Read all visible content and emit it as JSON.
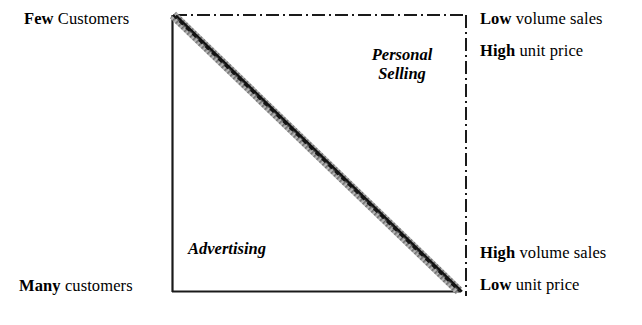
{
  "diagram": {
    "type": "marketing-communication-mix-triangle",
    "corner_labels": {
      "top_left": {
        "emphasis": "Few",
        "rest": " Customers"
      },
      "bottom_left": {
        "emphasis": "Many",
        "rest": " customers"
      },
      "top_right_line1": {
        "emphasis": "Low",
        "rest": " volume sales"
      },
      "top_right_line2": {
        "emphasis": "High",
        "rest": " unit price"
      },
      "bottom_right_line1": {
        "emphasis": "High",
        "rest": " volume sales"
      },
      "bottom_right_line2": {
        "emphasis": "Low",
        "rest": " unit price"
      }
    },
    "zones": [
      {
        "name": "personal-selling",
        "line1": "Personal",
        "line2": "Selling"
      },
      {
        "name": "advertising",
        "line1": "Advertising",
        "line2": ""
      }
    ],
    "colors": {
      "ink": "#1a1a1a",
      "band_fill": "#9a9a9a",
      "background": "#ffffff"
    }
  }
}
